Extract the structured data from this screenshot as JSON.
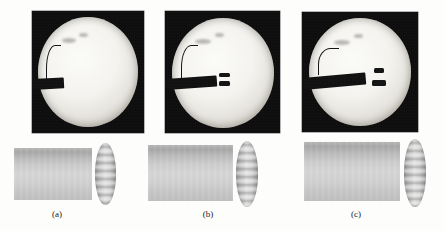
{
  "figure": {
    "background_color": "#fdfdfc",
    "panel_count": 3,
    "panels": [
      {
        "label": "(a)",
        "label_x": 57,
        "label_y": 209,
        "radiograph": {
          "x": 32,
          "y": 11,
          "width": 112,
          "height": 122,
          "background_color": "#0a0a0a",
          "phantom": {
            "cx": 56,
            "cy": 61,
            "rx": 50,
            "ry": 55,
            "fill": "#f4f3ef"
          },
          "instrument": {
            "rod_x": 0,
            "rod_y": 68,
            "rod_width": 32,
            "rod_height": 11,
            "rod_color": "#0d0d0d",
            "tip_marks": [],
            "wire": {
              "x": 14,
              "y": 34,
              "width": 14,
              "height": 38
            },
            "blobs": [
              {
                "x": 30,
                "y": 27,
                "w": 14,
                "h": 5
              },
              {
                "x": 47,
                "y": 22,
                "w": 9,
                "h": 4
              }
            ]
          }
        },
        "render": {
          "cylinder": {
            "x": 14,
            "y": 148,
            "width": 78,
            "height": 52
          },
          "cap": {
            "x": 95,
            "y": 143,
            "width": 21,
            "height": 62
          }
        }
      },
      {
        "label": "(b)",
        "label_x": 208,
        "label_y": 209,
        "radiograph": {
          "x": 165,
          "y": 11,
          "width": 115,
          "height": 122,
          "background_color": "#0a0a0a",
          "phantom": {
            "cx": 58,
            "cy": 62,
            "rx": 51,
            "ry": 55,
            "fill": "#f4f3ef"
          },
          "instrument": {
            "rod_x": 0,
            "rod_y": 68,
            "rod_width": 52,
            "rod_height": 11,
            "rod_color": "#0d0d0d",
            "tip_marks": [
              {
                "x": 54,
                "y": 62,
                "w": 11,
                "h": 4
              },
              {
                "x": 54,
                "y": 70,
                "w": 11,
                "h": 5
              }
            ],
            "wire": {
              "x": 16,
              "y": 34,
              "width": 16,
              "height": 36
            },
            "blobs": [
              {
                "x": 30,
                "y": 28,
                "w": 16,
                "h": 5
              },
              {
                "x": 50,
                "y": 22,
                "w": 9,
                "h": 4
              }
            ]
          }
        },
        "render": {
          "cylinder": {
            "x": 148,
            "y": 145,
            "width": 85,
            "height": 56
          },
          "cap": {
            "x": 236,
            "y": 141,
            "width": 22,
            "height": 66
          }
        }
      },
      {
        "label": "(c)",
        "label_x": 356,
        "label_y": 209,
        "radiograph": {
          "x": 302,
          "y": 12,
          "width": 116,
          "height": 120,
          "background_color": "#0a0a0a",
          "phantom": {
            "cx": 58,
            "cy": 60,
            "rx": 51,
            "ry": 54,
            "fill": "#f4f3ef"
          },
          "instrument": {
            "rod_x": 0,
            "rod_y": 66,
            "rod_width": 64,
            "rod_height": 12,
            "rod_color": "#0d0d0d",
            "tip_marks": [
              {
                "x": 72,
                "y": 56,
                "w": 10,
                "h": 5
              },
              {
                "x": 70,
                "y": 68,
                "w": 14,
                "h": 6
              }
            ],
            "wire": {
              "x": 16,
              "y": 36,
              "width": 20,
              "height": 26
            },
            "blobs": [
              {
                "x": 32,
                "y": 28,
                "w": 16,
                "h": 5
              },
              {
                "x": 52,
                "y": 22,
                "w": 9,
                "h": 4
              }
            ]
          }
        },
        "render": {
          "cylinder": {
            "x": 304,
            "y": 142,
            "width": 96,
            "height": 59
          },
          "cap": {
            "x": 404,
            "y": 139,
            "width": 22,
            "height": 68
          }
        }
      }
    ]
  }
}
